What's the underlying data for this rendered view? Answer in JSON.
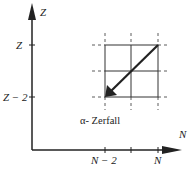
{
  "diagram": {
    "type": "nuclide-chart-decay",
    "axes": {
      "y_label": "Z",
      "x_label": "N",
      "y_ticks": [
        "Z",
        "Z − 2"
      ],
      "x_ticks": [
        "N − 2",
        "N"
      ]
    },
    "caption": "α-  Zerfall",
    "arrow": {
      "from": "(N, Z)",
      "to": "(N−2, Z−2)"
    },
    "colors": {
      "line": "#222222",
      "background": "#ffffff"
    }
  }
}
